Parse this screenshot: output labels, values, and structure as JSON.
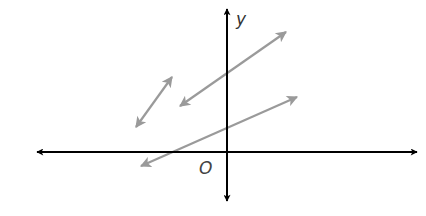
{
  "diagram": {
    "type": "coordinate-plane",
    "colors": {
      "axis": "#000000",
      "line": "#9a9a9a",
      "background": "#ffffff"
    },
    "axes": {
      "x": {
        "from": [
          37,
          152
        ],
        "to": [
          417,
          152
        ],
        "arrows": "both"
      },
      "y": {
        "from": [
          227,
          201
        ],
        "to": [
          227,
          9
        ],
        "arrows": "both",
        "label": "y",
        "label_pos": [
          236,
          25
        ]
      }
    },
    "origin": {
      "label": "O",
      "label_pos": [
        199,
        174
      ]
    },
    "lines": [
      {
        "name": "upper-line",
        "from": [
          180,
          106
        ],
        "to": [
          286,
          32
        ],
        "arrows": "both"
      },
      {
        "name": "short-line",
        "from": [
          136,
          127
        ],
        "to": [
          172,
          77
        ],
        "arrows": "both"
      },
      {
        "name": "lower-line",
        "from": [
          141,
          166
        ],
        "to": [
          297,
          97
        ],
        "arrows": "both"
      }
    ]
  }
}
